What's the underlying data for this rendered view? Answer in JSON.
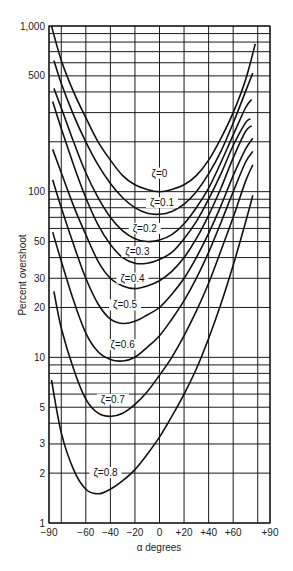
{
  "chart_data": {
    "type": "line",
    "title": "",
    "xlabel": "α degrees",
    "ylabel": "Percent overshoot",
    "xlim": [
      -90,
      90
    ],
    "ylim": [
      1,
      1000
    ],
    "yscale": "log",
    "grid": true,
    "legend": "inline curve labels",
    "x_ticks": [
      -90,
      -60,
      -40,
      -20,
      0,
      20,
      40,
      60,
      90
    ],
    "x_tick_labels": [
      "−90",
      "−60",
      "−40",
      "−20",
      "0",
      "+20",
      "+40",
      "+60",
      "+90"
    ],
    "x_gridlines": [
      -90,
      -80,
      -60,
      -40,
      -20,
      0,
      20,
      40,
      60,
      80,
      90
    ],
    "y_ticks": [
      1,
      2,
      3,
      5,
      10,
      20,
      30,
      50,
      100,
      500,
      1000
    ],
    "y_tick_labels": [
      "1",
      "2",
      "3",
      "5",
      "10",
      "20",
      "30",
      "50",
      "100",
      "500",
      "1,000"
    ],
    "series": [
      {
        "name": "ζ=0",
        "label_pos": [
          0,
          125
        ],
        "points": [
          [
            -88,
            1000
          ],
          [
            -80,
            620
          ],
          [
            -70,
            400
          ],
          [
            -60,
            280
          ],
          [
            -50,
            200
          ],
          [
            -40,
            155
          ],
          [
            -30,
            125
          ],
          [
            -20,
            110
          ],
          [
            -10,
            103
          ],
          [
            0,
            100
          ],
          [
            10,
            103
          ],
          [
            20,
            110
          ],
          [
            30,
            125
          ],
          [
            40,
            155
          ],
          [
            50,
            210
          ],
          [
            60,
            300
          ],
          [
            70,
            470
          ],
          [
            78,
            780
          ]
        ]
      },
      {
        "name": "ζ=0.1",
        "label_pos": [
          2,
          83
        ],
        "points": [
          [
            -86,
            620
          ],
          [
            -80,
            450
          ],
          [
            -70,
            290
          ],
          [
            -60,
            200
          ],
          [
            -50,
            145
          ],
          [
            -40,
            112
          ],
          [
            -30,
            92
          ],
          [
            -20,
            80
          ],
          [
            -10,
            74
          ],
          [
            0,
            73
          ],
          [
            10,
            76
          ],
          [
            20,
            84
          ],
          [
            30,
            100
          ],
          [
            40,
            128
          ],
          [
            50,
            175
          ],
          [
            60,
            260
          ],
          [
            70,
            400
          ],
          [
            76,
            520
          ]
        ]
      },
      {
        "name": "ζ=0.2",
        "label_pos": [
          -12,
          58
        ],
        "points": [
          [
            -86,
            420
          ],
          [
            -80,
            320
          ],
          [
            -70,
            200
          ],
          [
            -60,
            130
          ],
          [
            -50,
            92
          ],
          [
            -40,
            70
          ],
          [
            -30,
            58
          ],
          [
            -20,
            52
          ],
          [
            -10,
            50
          ],
          [
            0,
            51
          ],
          [
            10,
            55
          ],
          [
            20,
            64
          ],
          [
            30,
            80
          ],
          [
            40,
            105
          ],
          [
            50,
            150
          ],
          [
            60,
            220
          ],
          [
            70,
            320
          ],
          [
            75,
            360
          ]
        ]
      },
      {
        "name": "ζ=0.3",
        "label_pos": [
          -18,
          42
        ],
        "points": [
          [
            -87,
            350
          ],
          [
            -80,
            240
          ],
          [
            -70,
            145
          ],
          [
            -60,
            92
          ],
          [
            -50,
            63
          ],
          [
            -40,
            48
          ],
          [
            -30,
            40
          ],
          [
            -20,
            37
          ],
          [
            -10,
            37
          ],
          [
            0,
            39
          ],
          [
            10,
            43
          ],
          [
            20,
            52
          ],
          [
            30,
            66
          ],
          [
            40,
            90
          ],
          [
            50,
            128
          ],
          [
            60,
            190
          ],
          [
            70,
            260
          ],
          [
            74,
            275
          ]
        ]
      },
      {
        "name": "ζ=0.4",
        "label_pos": [
          -22,
          29
        ],
        "points": [
          [
            -87,
            180
          ],
          [
            -80,
            130
          ],
          [
            -70,
            82
          ],
          [
            -60,
            55
          ],
          [
            -50,
            38
          ],
          [
            -40,
            30
          ],
          [
            -30,
            27
          ],
          [
            -20,
            26
          ],
          [
            -10,
            27
          ],
          [
            0,
            29
          ],
          [
            10,
            33
          ],
          [
            20,
            40
          ],
          [
            30,
            52
          ],
          [
            40,
            72
          ],
          [
            50,
            105
          ],
          [
            60,
            160
          ],
          [
            70,
            230
          ],
          [
            75,
            250
          ]
        ]
      },
      {
        "name": "ζ=0.5",
        "label_pos": [
          -28,
          20
        ],
        "points": [
          [
            -87,
            118
          ],
          [
            -80,
            80
          ],
          [
            -70,
            48
          ],
          [
            -60,
            30
          ],
          [
            -50,
            21
          ],
          [
            -40,
            17
          ],
          [
            -30,
            16
          ],
          [
            -20,
            16.5
          ],
          [
            -10,
            18
          ],
          [
            0,
            20
          ],
          [
            10,
            24
          ],
          [
            20,
            30
          ],
          [
            30,
            40
          ],
          [
            40,
            56
          ],
          [
            50,
            82
          ],
          [
            60,
            125
          ],
          [
            70,
            180
          ],
          [
            76,
            210
          ]
        ]
      },
      {
        "name": "ζ=0.6",
        "label_pos": [
          -30,
          11.5
        ],
        "points": [
          [
            -87,
            57
          ],
          [
            -80,
            38
          ],
          [
            -70,
            22
          ],
          [
            -60,
            14
          ],
          [
            -50,
            10.8
          ],
          [
            -40,
            9.7
          ],
          [
            -30,
            9.5
          ],
          [
            -20,
            10
          ],
          [
            -10,
            11.5
          ],
          [
            0,
            13.5
          ],
          [
            10,
            17
          ],
          [
            20,
            22
          ],
          [
            30,
            30
          ],
          [
            40,
            43
          ],
          [
            50,
            65
          ],
          [
            60,
            100
          ],
          [
            70,
            150
          ],
          [
            76,
            175
          ]
        ]
      },
      {
        "name": "ζ=0.7",
        "label_pos": [
          -38,
          5.4
        ],
        "points": [
          [
            -86,
            25
          ],
          [
            -80,
            15
          ],
          [
            -70,
            8.5
          ],
          [
            -60,
            5.6
          ],
          [
            -50,
            4.6
          ],
          [
            -40,
            4.4
          ],
          [
            -30,
            4.6
          ],
          [
            -20,
            5.2
          ],
          [
            -10,
            6.2
          ],
          [
            0,
            7.8
          ],
          [
            10,
            10
          ],
          [
            20,
            13.5
          ],
          [
            30,
            19
          ],
          [
            40,
            28
          ],
          [
            50,
            44
          ],
          [
            60,
            70
          ],
          [
            70,
            115
          ],
          [
            76,
            145
          ]
        ]
      },
      {
        "name": "ζ=0.8",
        "label_pos": [
          -44,
          1.95
        ],
        "points": [
          [
            -88,
            7.3
          ],
          [
            -80,
            3.5
          ],
          [
            -70,
            2.1
          ],
          [
            -60,
            1.6
          ],
          [
            -50,
            1.5
          ],
          [
            -40,
            1.6
          ],
          [
            -30,
            1.8
          ],
          [
            -20,
            2.1
          ],
          [
            -10,
            2.6
          ],
          [
            0,
            3.3
          ],
          [
            10,
            4.4
          ],
          [
            20,
            6
          ],
          [
            30,
            8.5
          ],
          [
            40,
            13
          ],
          [
            50,
            21
          ],
          [
            60,
            36
          ],
          [
            70,
            65
          ],
          [
            76,
            95
          ]
        ]
      }
    ]
  },
  "caption": ""
}
